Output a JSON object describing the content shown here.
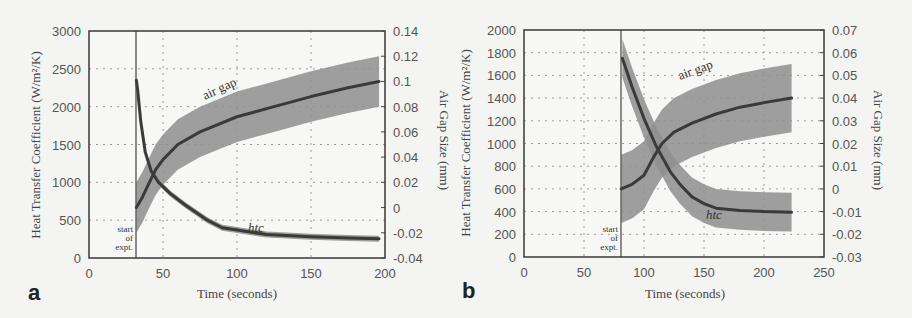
{
  "chart_data": [
    {
      "panel": "a",
      "type": "line",
      "xlabel": "Time (seconds)",
      "ylabel": "Heat Transfer Coefficient (W/m²/K)",
      "y2label": "Air Gap Size (mm)",
      "xlim": [
        0,
        200
      ],
      "ylim": [
        0,
        3000
      ],
      "y2lim": [
        -0.04,
        0.14
      ],
      "xticks": [
        "0",
        "50",
        "100",
        "150",
        "200"
      ],
      "yticks": [
        "0",
        "500",
        "1000",
        "1500",
        "2000",
        "2500",
        "3000"
      ],
      "y2ticks": [
        "-0.04",
        "-0.02",
        "0",
        "0.02",
        "0.04",
        "0.06",
        "0.08",
        "0.1",
        "0.12",
        "0.14"
      ],
      "grid": true,
      "annotations": [
        "start of expt.",
        "air gap",
        "htc"
      ],
      "start_time": 32,
      "series": [
        {
          "name": "htc",
          "axis": "left",
          "x": [
            32,
            33,
            35,
            38,
            42,
            47,
            55,
            65,
            80,
            90,
            100,
            120,
            150,
            175,
            196
          ],
          "values": [
            2350,
            2200,
            1800,
            1400,
            1150,
            1000,
            850,
            700,
            500,
            400,
            370,
            310,
            280,
            265,
            255
          ],
          "band_halfwidth": 40
        },
        {
          "name": "air gap",
          "axis": "right",
          "x": [
            32,
            36,
            40,
            45,
            50,
            60,
            75,
            100,
            125,
            150,
            175,
            196
          ],
          "values": [
            0.0,
            0.008,
            0.018,
            0.03,
            0.038,
            0.05,
            0.06,
            0.072,
            0.08,
            0.088,
            0.095,
            0.1
          ],
          "band_halfwidth": 0.02
        }
      ]
    },
    {
      "panel": "b",
      "type": "line",
      "xlabel": "Time (seconds)",
      "ylabel": "Heat Transfer Coefficient (W/m²/K)",
      "y2label": "Air Gap Size (mm)",
      "xlim": [
        0,
        250
      ],
      "ylim": [
        0,
        2000
      ],
      "y2lim": [
        -0.03,
        0.07
      ],
      "xticks": [
        "0",
        "50",
        "100",
        "150",
        "200",
        "250"
      ],
      "yticks": [
        "0",
        "200",
        "400",
        "600",
        "800",
        "1000",
        "1200",
        "1400",
        "1600",
        "1800",
        "2000"
      ],
      "y2ticks": [
        "-0.03",
        "-0.02",
        "-0.01",
        "0",
        "0.01",
        "0.02",
        "0.03",
        "0.04",
        "0.05",
        "0.06",
        "0.07"
      ],
      "grid": true,
      "annotations": [
        "start of expt.",
        "air gap",
        "htc"
      ],
      "start_time": 81,
      "series": [
        {
          "name": "htc",
          "axis": "left",
          "x": [
            82,
            90,
            100,
            110,
            122,
            130,
            140,
            150,
            160,
            180,
            200,
            223
          ],
          "values": [
            1750,
            1500,
            1220,
            980,
            750,
            640,
            530,
            470,
            430,
            410,
            400,
            395
          ],
          "band_halfwidth": 170
        },
        {
          "name": "air gap",
          "axis": "right",
          "x": [
            81,
            90,
            100,
            108,
            115,
            125,
            140,
            160,
            180,
            200,
            223
          ],
          "values": [
            0.0,
            0.002,
            0.006,
            0.014,
            0.02,
            0.025,
            0.029,
            0.033,
            0.036,
            0.038,
            0.04
          ],
          "band_halfwidth": 0.015
        }
      ]
    }
  ],
  "panels": {
    "a": {
      "label": "a",
      "xlabel": "Time (seconds)",
      "ylabel": "Heat Transfer Coefficient (W/m²/K)",
      "y2label": "Air Gap Size (mm)",
      "annot_airgap": "air gap",
      "annot_htc": "htc",
      "annot_start1": "start",
      "annot_start2": "of",
      "annot_start3": "expt."
    },
    "b": {
      "label": "b",
      "xlabel": "Time (seconds)",
      "ylabel": "Heat Transfer Coefficient (W/m²/K)",
      "y2label": "Air Gap Size (mm)",
      "annot_airgap": "air gap",
      "annot_htc": "htc",
      "annot_start1": "start",
      "annot_start2": "of",
      "annot_start3": "expt."
    }
  }
}
